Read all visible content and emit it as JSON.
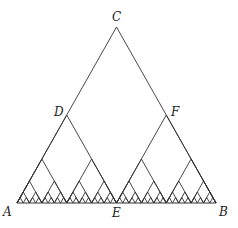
{
  "diagram": {
    "type": "recursive-triangle-tree",
    "stroke_color": "#333333",
    "background": "#ffffff",
    "vertices": {
      "A": [
        17,
        203
      ],
      "B": [
        216,
        203
      ],
      "C": [
        116.5,
        27
      ]
    },
    "recursion_depth": 6,
    "labels": [
      {
        "id": "C",
        "text": "C",
        "x": 112,
        "y": 21
      },
      {
        "id": "D",
        "text": "D",
        "x": 54,
        "y": 116
      },
      {
        "id": "F",
        "text": "F",
        "x": 171,
        "y": 116
      },
      {
        "id": "A",
        "text": "A",
        "x": 3,
        "y": 216
      },
      {
        "id": "E",
        "text": "E",
        "x": 112,
        "y": 217
      },
      {
        "id": "B",
        "text": "B",
        "x": 219,
        "y": 216
      }
    ]
  }
}
